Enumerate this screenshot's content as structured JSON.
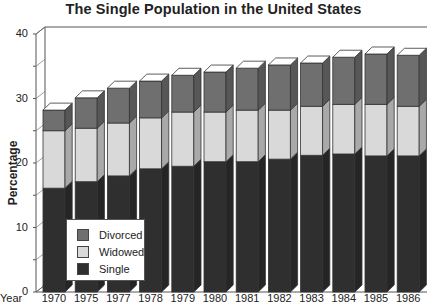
{
  "chart_data": {
    "type": "bar",
    "stacked": true,
    "style": "3d",
    "title": "The Single Population in the United States",
    "xlabel": "Year",
    "ylabel": "Percentage",
    "ylim": [
      0,
      40
    ],
    "yticks": [
      0,
      10,
      20,
      30,
      40
    ],
    "ytick_labels": [
      "0",
      "10",
      "20",
      "30",
      "40"
    ],
    "grid": false,
    "legend_position": "lower-left inside",
    "categories": [
      "1970",
      "1975",
      "1977",
      "1978",
      "1979",
      "1980",
      "1981",
      "1982",
      "1983",
      "1984",
      "1985",
      "1986"
    ],
    "series": [
      {
        "name": "Single",
        "color": "#2f2f2f",
        "values": [
          16.1,
          17.1,
          18.0,
          19.1,
          19.5,
          20.2,
          20.2,
          20.6,
          21.2,
          21.4,
          21.1,
          21.1
        ]
      },
      {
        "name": "Widowed",
        "color": "#d9d9d9",
        "values": [
          8.9,
          8.3,
          8.2,
          7.9,
          8.4,
          7.7,
          8.0,
          7.6,
          7.6,
          7.7,
          8.0,
          7.7
        ]
      },
      {
        "name": "Divorced",
        "color": "#6f6f6f",
        "values": [
          3.2,
          4.7,
          5.4,
          5.7,
          5.7,
          6.2,
          6.5,
          7.0,
          6.7,
          7.3,
          7.8,
          7.9
        ]
      }
    ],
    "totals": [
      28.2,
      30.1,
      31.6,
      32.7,
      33.6,
      34.1,
      34.7,
      35.2,
      35.5,
      36.4,
      36.9,
      36.7
    ]
  },
  "legend": {
    "items": [
      {
        "label": "Divorced",
        "color": "#6f6f6f"
      },
      {
        "label": "Widowed",
        "color": "#d9d9d9"
      },
      {
        "label": "Single",
        "color": "#2f2f2f"
      }
    ]
  }
}
